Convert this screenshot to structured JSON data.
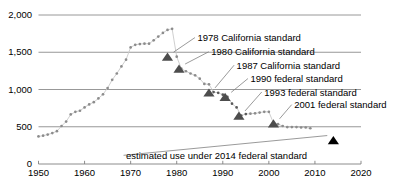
{
  "chart_data": {
    "type": "scatter",
    "title": "",
    "subtitle": "",
    "xlabel": "",
    "ylabel": "",
    "xlim": [
      1950,
      2020
    ],
    "ylim": [
      0,
      2000
    ],
    "grid": true,
    "legend_position": "none",
    "x_ticks": [
      1950,
      1960,
      1970,
      1980,
      1990,
      2000,
      2010,
      2020
    ],
    "x_tick_labels": [
      "1950",
      "1960",
      "1970",
      "1980",
      "1990",
      "2000",
      "2010",
      "2020"
    ],
    "y_ticks": [
      0,
      500,
      1000,
      1500,
      2000
    ],
    "y_tick_labels": [
      "0",
      "500",
      "1,000",
      "1,500",
      "2,000"
    ],
    "series": [
      {
        "name": "average energy use per refrigerator",
        "marker": "dot",
        "color": "#808080",
        "points": [
          [
            1950,
            370
          ],
          [
            1951,
            380
          ],
          [
            1952,
            395
          ],
          [
            1953,
            415
          ],
          [
            1954,
            440
          ],
          [
            1955,
            510
          ],
          [
            1956,
            570
          ],
          [
            1957,
            665
          ],
          [
            1958,
            700
          ],
          [
            1959,
            715
          ],
          [
            1960,
            760
          ],
          [
            1961,
            800
          ],
          [
            1962,
            830
          ],
          [
            1963,
            880
          ],
          [
            1964,
            935
          ],
          [
            1965,
            1020
          ],
          [
            1966,
            1130
          ],
          [
            1967,
            1215
          ],
          [
            1968,
            1310
          ],
          [
            1969,
            1400
          ],
          [
            1970,
            1565
          ],
          [
            1971,
            1600
          ],
          [
            1972,
            1610
          ],
          [
            1973,
            1615
          ],
          [
            1974,
            1615
          ],
          [
            1975,
            1660
          ],
          [
            1976,
            1710
          ],
          [
            1977,
            1760
          ],
          [
            1978,
            1800
          ],
          [
            1979,
            1815
          ],
          [
            1980,
            1440
          ],
          [
            1981,
            1280
          ],
          [
            1982,
            1245
          ],
          [
            1983,
            1215
          ],
          [
            1984,
            1190
          ],
          [
            1985,
            1145
          ],
          [
            1986,
            1075
          ],
          [
            1987,
            1070
          ],
          [
            1988,
            965
          ],
          [
            1989,
            955
          ],
          [
            1990,
            930
          ],
          [
            1991,
            900
          ],
          [
            1992,
            810
          ],
          [
            1993,
            760
          ],
          [
            1994,
            650
          ],
          [
            1995,
            670
          ],
          [
            1996,
            675
          ],
          [
            1997,
            680
          ],
          [
            1998,
            690
          ],
          [
            1999,
            700
          ],
          [
            2000,
            700
          ],
          [
            2001,
            550
          ],
          [
            2002,
            535
          ],
          [
            2003,
            510
          ],
          [
            2004,
            495
          ],
          [
            2005,
            495
          ],
          [
            2006,
            495
          ],
          [
            2007,
            490
          ],
          [
            2008,
            490
          ],
          [
            2009,
            480
          ]
        ]
      }
    ],
    "annotations": [
      {
        "id": "std-1978-california",
        "label": "1978 California standard",
        "marker": "triangle",
        "marker_color": "#4d4d4d",
        "point": [
          1978,
          1440
        ],
        "label_x": 1984.5,
        "label_y": 1690
      },
      {
        "id": "std-1980-california",
        "label": "1980 California standard",
        "marker": "triangle",
        "marker_color": "#4d4d4d",
        "point": [
          1980.5,
          1280
        ],
        "label_x": 1987.5,
        "label_y": 1500
      },
      {
        "id": "std-1987-california",
        "label": "1987 California standard",
        "marker": "triangle",
        "marker_color": "#4d4d4d",
        "point": [
          1987,
          960
        ],
        "label_x": 1993.0,
        "label_y": 1320
      },
      {
        "id": "std-1990-federal",
        "label": "1990 federal standard",
        "marker": "triangle",
        "marker_color": "#4d4d4d",
        "point": [
          1990.5,
          900
        ],
        "label_x": 1996.0,
        "label_y": 1140
      },
      {
        "id": "std-1993-federal",
        "label": "1993 federal standard",
        "marker": "triangle",
        "marker_color": "#4d4d4d",
        "point": [
          1993.5,
          650
        ],
        "label_x": 1999.0,
        "label_y": 960
      },
      {
        "id": "std-2001-federal",
        "label": "2001 federal standard",
        "marker": "triangle",
        "marker_color": "#4d4d4d",
        "point": [
          2001,
          545
        ],
        "label_x": 2005.5,
        "label_y": 790
      },
      {
        "id": "std-2014-federal-estimated",
        "label": "estimated use under 2014 federal standard",
        "marker": "triangle",
        "marker_color": "#000000",
        "point": [
          2014,
          320
        ],
        "label_x": 1969.0,
        "label_y": 110
      }
    ],
    "colors": {
      "gridline": "#8c8c8c",
      "axis": "#808080",
      "dot": "#8c8c8c",
      "dot_dark": "#595959",
      "triangle": "#4d4d4d",
      "triangle_estimated": "#000000",
      "text": "#000000",
      "leader": "#808080",
      "background": "#ffffff"
    }
  }
}
